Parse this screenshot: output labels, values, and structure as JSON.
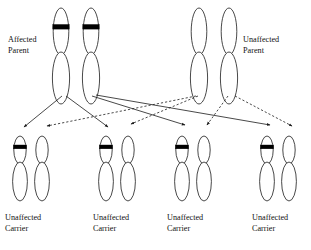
{
  "diagram": {
    "colors": {
      "stroke": "#1a1a1a",
      "band": "#000000",
      "background": "#ffffff"
    },
    "parents": [
      {
        "id": "affected-parent",
        "label_line1": "Affected",
        "label_line2": "Parent",
        "side": "left",
        "label_x": 8,
        "label_y": 42,
        "chromosomes": [
          {
            "id": "p1-chr-a",
            "x": 61,
            "banded": true
          },
          {
            "id": "p1-chr-b",
            "x": 91,
            "banded": true
          }
        ]
      },
      {
        "id": "unaffected-parent",
        "label_line1": "Unaffected",
        "label_line2": "Parent",
        "side": "right",
        "label_x": 243,
        "label_y": 42,
        "chromosomes": [
          {
            "id": "p2-chr-a",
            "x": 199,
            "banded": false
          },
          {
            "id": "p2-chr-b",
            "x": 229,
            "banded": false
          }
        ]
      }
    ],
    "offspring": [
      {
        "id": "offspring-1",
        "label_line1": "Unaffected",
        "label_line2": "Carrier",
        "label_x": 5,
        "chromosomes": [
          {
            "id": "o1-chr-a",
            "x": 20,
            "banded": true
          },
          {
            "id": "o1-chr-b",
            "x": 42,
            "banded": false
          }
        ]
      },
      {
        "id": "offspring-2",
        "label_line1": "Unaffected",
        "label_line2": "Carrier",
        "label_x": 93,
        "chromosomes": [
          {
            "id": "o2-chr-a",
            "x": 106,
            "banded": true
          },
          {
            "id": "o2-chr-b",
            "x": 128,
            "banded": false
          }
        ]
      },
      {
        "id": "offspring-3",
        "label_line1": "Unaffected",
        "label_line2": "Carrier",
        "label_x": 167,
        "chromosomes": [
          {
            "id": "o3-chr-a",
            "x": 182,
            "banded": true
          },
          {
            "id": "o3-chr-b",
            "x": 204,
            "banded": false
          }
        ]
      },
      {
        "id": "offspring-4",
        "label_line1": "Unaffected",
        "label_line2": "Carrier",
        "label_x": 252,
        "chromosomes": [
          {
            "id": "o4-chr-a",
            "x": 267,
            "banded": true
          },
          {
            "id": "o4-chr-b",
            "x": 289,
            "banded": false
          }
        ]
      }
    ],
    "inheritance_lines": [
      {
        "id": "line-affected-to-o1",
        "style": "solid",
        "from": "p1-chr-a",
        "to": "offspring-1",
        "x1": 62,
        "y1": 96,
        "x2": 24,
        "y2": 127
      },
      {
        "id": "line-affected-to-o2",
        "style": "solid",
        "from": "p1-chr-a",
        "to": "offspring-2",
        "x1": 66,
        "y1": 96,
        "x2": 108,
        "y2": 127
      },
      {
        "id": "line-affected-to-o3",
        "style": "solid",
        "from": "p1-chr-b",
        "to": "offspring-3",
        "x1": 92,
        "y1": 96,
        "x2": 185,
        "y2": 125
      },
      {
        "id": "line-affected-to-o4",
        "style": "solid",
        "from": "p1-chr-b",
        "to": "offspring-4",
        "x1": 96,
        "y1": 95,
        "x2": 270,
        "y2": 125
      },
      {
        "id": "line-unaffected-to-o1",
        "style": "dashed",
        "from": "p2-chr-a",
        "to": "offspring-1",
        "x1": 196,
        "y1": 96,
        "x2": 47,
        "y2": 126
      },
      {
        "id": "line-unaffected-to-o2",
        "style": "dashed",
        "from": "p2-chr-a",
        "to": "offspring-2",
        "x1": 198,
        "y1": 96,
        "x2": 131,
        "y2": 124
      },
      {
        "id": "line-unaffected-to-o3",
        "style": "dashed",
        "from": "p2-chr-b",
        "to": "offspring-3",
        "x1": 228,
        "y1": 96,
        "x2": 207,
        "y2": 125
      },
      {
        "id": "line-unaffected-to-o4",
        "style": "dashed",
        "from": "p2-chr-b",
        "to": "offspring-4",
        "x1": 235,
        "y1": 96,
        "x2": 292,
        "y2": 126
      }
    ]
  }
}
